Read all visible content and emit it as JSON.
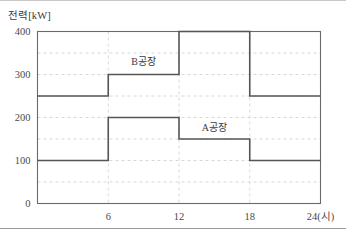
{
  "figure": {
    "y_axis_title": "전력[kW]",
    "x_axis_unit_label": "24(시)"
  },
  "chart_data": {
    "type": "line",
    "subtype": "step-post",
    "title": "",
    "xlabel": "(시)",
    "ylabel": "전력[kW]",
    "xlim": [
      0,
      24
    ],
    "ylim": [
      0,
      400
    ],
    "x_ticks": [
      0,
      6,
      12,
      18,
      24
    ],
    "x_tick_labels": [
      "",
      "6",
      "12",
      "18",
      "24(시)"
    ],
    "y_ticks": [
      0,
      100,
      200,
      300,
      400
    ],
    "y_tick_labels": [
      "0",
      "100",
      "200",
      "300",
      "400"
    ],
    "grid": {
      "x_gridlines": [
        6,
        12,
        18
      ],
      "y_gridlines": [
        50,
        100,
        150,
        200,
        250,
        300,
        350
      ],
      "style": "dashed",
      "color": "#d8d8d8"
    },
    "legend": "inline-annotations",
    "x_intervals": [
      [
        0,
        6
      ],
      [
        6,
        12
      ],
      [
        12,
        18
      ],
      [
        18,
        24
      ]
    ],
    "series": [
      {
        "name": "B공장",
        "label_x": 9.0,
        "label_y": 322,
        "color": "#555555",
        "values": [
          250,
          300,
          400,
          250
        ]
      },
      {
        "name": "A공장",
        "label_x": 15.0,
        "label_y": 168,
        "color": "#555555",
        "values": [
          100,
          200,
          150,
          100
        ]
      }
    ]
  }
}
